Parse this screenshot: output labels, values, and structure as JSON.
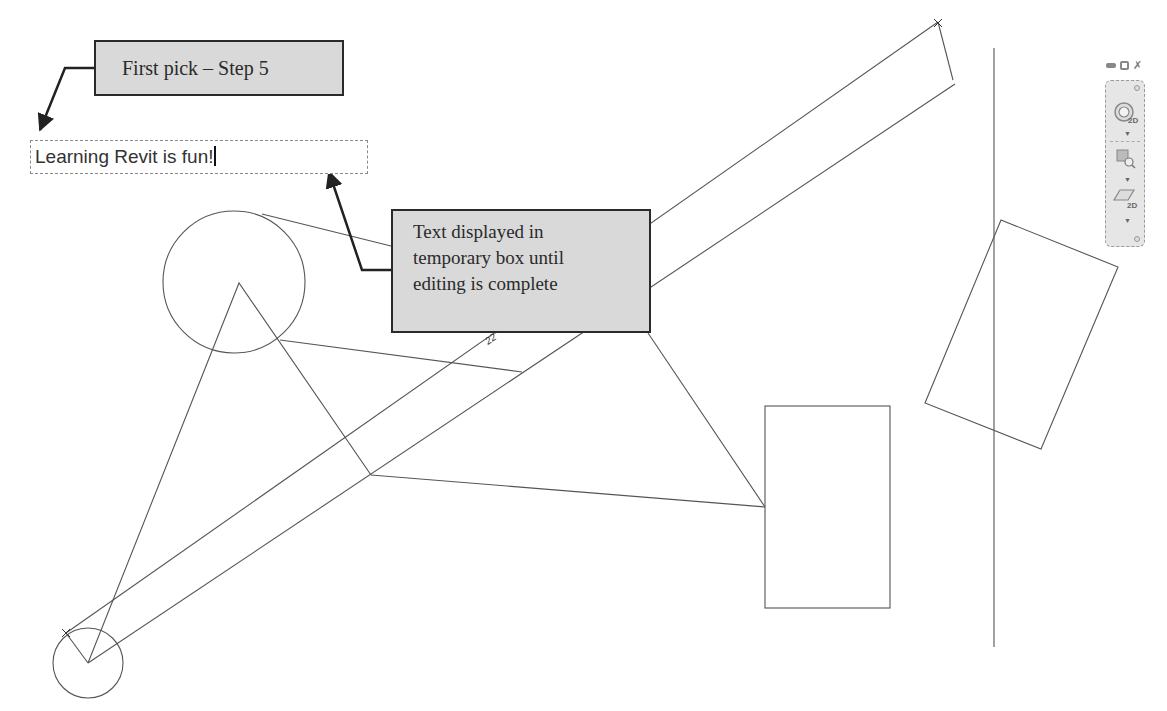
{
  "callouts": {
    "first_pick": "First pick – Step 5",
    "temp_box_lines": [
      "Text displayed in",
      "temporary box until",
      "editing is complete"
    ]
  },
  "text_editor": {
    "value": "Learning Revit is fun!"
  },
  "window_controls": {
    "minimize_icon": "minimize-icon",
    "restore_icon": "restore-icon",
    "close_icon": "close-icon"
  },
  "navigation_bar": {
    "tools": [
      {
        "name": "steering-wheel-2d",
        "icon": "steering-wheel-icon",
        "badge": "2D"
      },
      {
        "name": "zoom-region",
        "icon": "zoom-region-icon",
        "badge": ""
      },
      {
        "name": "view-2d",
        "icon": "plane-2d-icon",
        "badge": "2D"
      }
    ]
  },
  "drawing": {
    "dimension_label": "22'",
    "colors": {
      "line": "#555555",
      "callout_fill": "#d9d9d9",
      "callout_border": "#2a2a2a",
      "leader": "#222222"
    }
  }
}
